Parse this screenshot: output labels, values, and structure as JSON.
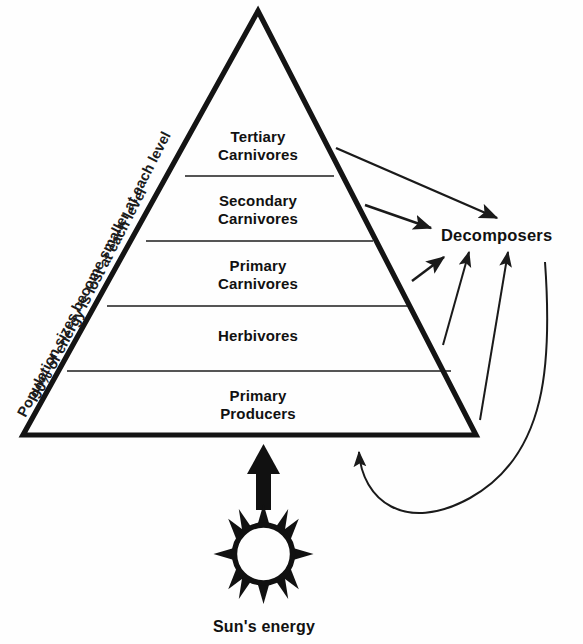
{
  "diagram": {
    "type": "ecological-pyramid",
    "background_color": "#fefefe",
    "outline_color": "#111111",
    "divider_color": "#555555",
    "arrow_color": "#1a1a1a"
  },
  "pyramid": {
    "tiers": [
      {
        "id": "tertiary-carnivores",
        "label": "Tertiary\nCarnivores",
        "level": 5
      },
      {
        "id": "secondary-carnivores",
        "label": "Secondary\nCarnivores",
        "level": 4
      },
      {
        "id": "primary-carnivores",
        "label": "Primary\nCarnivores",
        "level": 3
      },
      {
        "id": "herbivores",
        "label": "Herbivores",
        "level": 2
      },
      {
        "id": "primary-producers",
        "label": "Primary\nProducers",
        "level": 1
      }
    ]
  },
  "annotations": {
    "energy_loss_note": "90% of energy is lost at each level",
    "population_note": "Population sizes become smaller at each level",
    "decomposers_label": "Decomposers",
    "sun_caption": "Sun's energy"
  },
  "icons": {
    "sun": "sun-icon",
    "energy_arrow": "up-arrow-icon",
    "recycle_arrow": "curved-return-arrow-icon",
    "decomposer_arrows": "arrow-to-decomposers-icon"
  }
}
